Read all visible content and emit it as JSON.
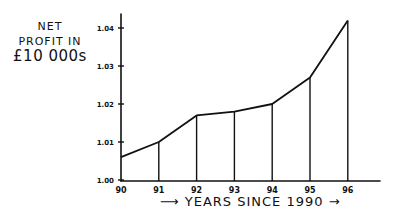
{
  "chart_data": {
    "type": "line",
    "title": "",
    "ylabel": "NET PROFIT IN £10 000s",
    "ylabel_lines": [
      "NET",
      "PROFIT IN",
      "£10 000s"
    ],
    "xlabel": "YEARS SINCE 1990",
    "xlabel_display": "⟶ YEARS SINCE 1990 →",
    "categories": [
      "90",
      "91",
      "92",
      "93",
      "94",
      "95",
      "96"
    ],
    "x": [
      90,
      91,
      92,
      93,
      94,
      95,
      96
    ],
    "values": [
      1.006,
      1.01,
      1.017,
      1.018,
      1.02,
      1.027,
      1.042
    ],
    "yticks": [
      "1.00",
      "1.01",
      "1.02",
      "1.03",
      "1.04"
    ],
    "ylim": [
      1.0,
      1.045
    ],
    "grid": false,
    "legend": null,
    "drop_lines": true,
    "style": "hand-drawn"
  }
}
